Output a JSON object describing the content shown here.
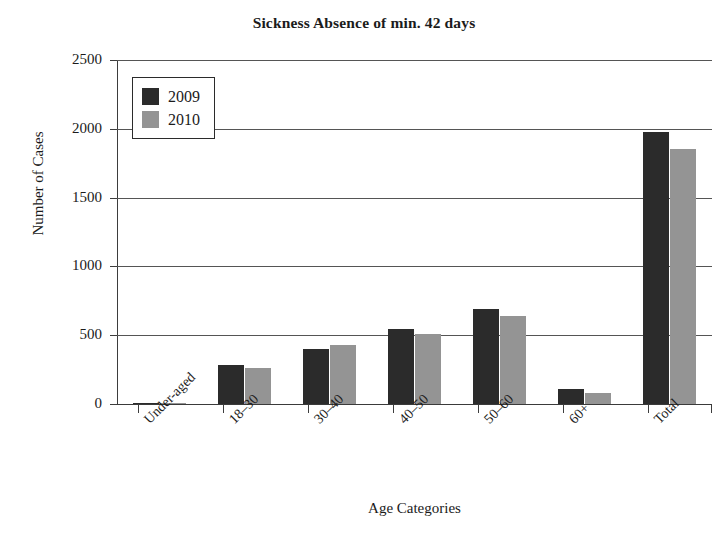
{
  "chart_data": {
    "type": "bar",
    "title": "Sickness Absence of min. 42 days",
    "xlabel": "Age Categories",
    "ylabel": "Number of Cases",
    "categories": [
      "Under-aged",
      "18–30",
      "30–40",
      "40–50",
      "50–60",
      "60+",
      "Total"
    ],
    "series": [
      {
        "name": "2009",
        "color": "#2b2b2b",
        "values": [
          8,
          285,
          400,
          545,
          690,
          112,
          1975
        ]
      },
      {
        "name": "2010",
        "color": "#949494",
        "values": [
          6,
          262,
          432,
          510,
          640,
          82,
          1855
        ]
      }
    ],
    "ylim": [
      0,
      2500
    ],
    "ytick_labels": [
      "2500",
      "2000",
      "1500",
      "1000",
      "500",
      "0"
    ],
    "ytick_values": [
      2500,
      2000,
      1500,
      1000,
      500,
      0
    ],
    "grid": true,
    "legend_position": "top-left"
  },
  "legend": {
    "entries": [
      {
        "label": "2009",
        "color": "#2b2b2b"
      },
      {
        "label": "2010",
        "color": "#949494"
      }
    ]
  }
}
